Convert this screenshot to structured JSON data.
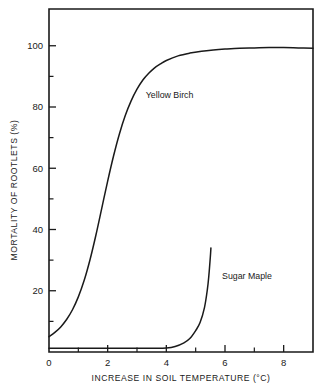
{
  "chart_data": {
    "type": "line",
    "title": "",
    "xlabel": "INCREASE IN SOIL TEMPERATURE (°C)",
    "ylabel": "MORTALITY OF ROOTLETS (%)",
    "xlim": [
      0,
      9
    ],
    "ylim": [
      0,
      112
    ],
    "grid": false,
    "legend_position": "inline-annotations",
    "xticks": [
      0,
      2,
      4,
      6,
      8
    ],
    "xticklabels": [
      "0",
      "2",
      "4",
      "6",
      "8"
    ],
    "xminorticks": [
      1,
      3,
      5,
      7
    ],
    "yticks": [
      20,
      40,
      60,
      80,
      100
    ],
    "yticklabels": [
      "20",
      "40",
      "60",
      "80",
      "100"
    ],
    "yminorticks": [
      10,
      30,
      50,
      70,
      90
    ],
    "series": [
      {
        "name": "Yellow Birch",
        "label_x": 3.3,
        "label_y": 83,
        "x": [
          0.0,
          0.2,
          0.4,
          0.6,
          0.8,
          1.0,
          1.2,
          1.4,
          1.6,
          1.8,
          2.0,
          2.2,
          2.4,
          2.6,
          2.8,
          3.0,
          3.2,
          3.4,
          3.6,
          3.8,
          4.0,
          4.4,
          4.8,
          5.2,
          5.6,
          6.0,
          6.5,
          7.0,
          7.5,
          8.0,
          8.5,
          9.0
        ],
        "values": [
          5.0,
          6.4,
          8.2,
          10.6,
          13.8,
          18.0,
          23.4,
          30.2,
          38.2,
          47.0,
          55.8,
          64.0,
          71.2,
          77.2,
          82.0,
          85.8,
          88.8,
          91.0,
          92.8,
          94.1,
          95.2,
          96.7,
          97.6,
          98.2,
          98.6,
          98.9,
          99.2,
          99.3,
          99.4,
          99.4,
          99.3,
          99.2
        ]
      },
      {
        "name": "Sugar Maple",
        "label_x": 5.9,
        "label_y": 24,
        "x": [
          0.0,
          1.0,
          2.0,
          3.0,
          3.6,
          4.0,
          4.3,
          4.6,
          4.8,
          5.0,
          5.15,
          5.3,
          5.4,
          5.45,
          5.5,
          5.52
        ],
        "values": [
          1.2,
          1.2,
          1.2,
          1.2,
          1.2,
          1.3,
          1.8,
          3.0,
          4.4,
          7.0,
          9.6,
          14.5,
          20.5,
          25.0,
          31.0,
          34.0
        ]
      }
    ]
  },
  "colors": {
    "ink": "#1a1a1a",
    "background": "#ffffff"
  }
}
